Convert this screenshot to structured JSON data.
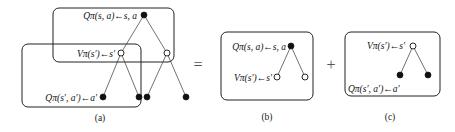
{
  "panels": {
    "a": {
      "caption": "(a)",
      "labels": {
        "q_root": "Qπ(s, a)←s, a",
        "v_mid": "Vπ(s′)←s′",
        "q_leaf": "Qπ(s′, a′)←a′"
      }
    },
    "b": {
      "caption": "(b)",
      "labels": {
        "q_root": "Qπ(s, a)←s, a",
        "v_child": "Vπ(s′)←s′"
      }
    },
    "c": {
      "caption": "(c)",
      "labels": {
        "v_root": "Vπ(s′)←s′",
        "q_child": "Qπ(s′, a′)←a′"
      }
    }
  },
  "operators": {
    "equals": "=",
    "plus": "+"
  },
  "legend": {
    "filled_node": "state-action node",
    "open_node": "state node"
  }
}
